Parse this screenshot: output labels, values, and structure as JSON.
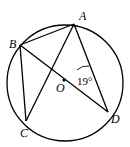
{
  "diagram": {
    "type": "circle-geometry",
    "circle": {
      "cx": 65,
      "cy": 83,
      "r": 58
    },
    "points": {
      "A": {
        "label": "A",
        "x": 74,
        "y": 24,
        "lx": 79,
        "ly": 20
      },
      "B": {
        "label": "B",
        "x": 20,
        "y": 45,
        "lx": 9,
        "ly": 46
      },
      "C": {
        "label": "C",
        "x": 26,
        "y": 121,
        "lx": 20,
        "ly": 137
      },
      "D": {
        "label": "D",
        "x": 108,
        "y": 112,
        "lx": 111,
        "ly": 123
      },
      "O": {
        "label": "O",
        "x": 64,
        "y": 80,
        "lx": 56,
        "ly": 92
      }
    },
    "segments": [
      [
        "A",
        "B"
      ],
      [
        "B",
        "C"
      ],
      [
        "A",
        "C"
      ],
      [
        "A",
        "D"
      ],
      [
        "B",
        "D"
      ]
    ],
    "angle_annotation": {
      "text": "19°",
      "vertex": "O",
      "x": 79,
      "y": 85
    }
  }
}
